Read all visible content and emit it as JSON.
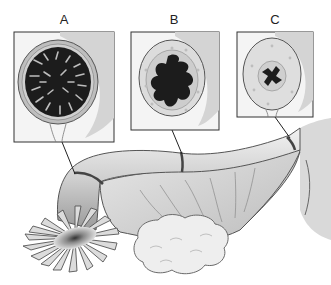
{
  "diagram": {
    "panels": [
      {
        "id": "A",
        "label": "A",
        "region": "infundibulum-ampulla",
        "lumen": "highly-folded-large"
      },
      {
        "id": "B",
        "label": "B",
        "region": "ampulla-isthmus",
        "lumen": "moderately-folded"
      },
      {
        "id": "C",
        "label": "C",
        "region": "isthmus",
        "lumen": "small-star-shaped"
      }
    ],
    "structures": [
      "fimbriae",
      "uterine-tube",
      "ovary",
      "broad-ligament",
      "uterus"
    ],
    "colors": {
      "background": "#ffffff",
      "outline": "#3a3a3a",
      "tissue": "#d8d8d8",
      "lumen": "#1c1c1c",
      "frame": "#333333"
    }
  }
}
